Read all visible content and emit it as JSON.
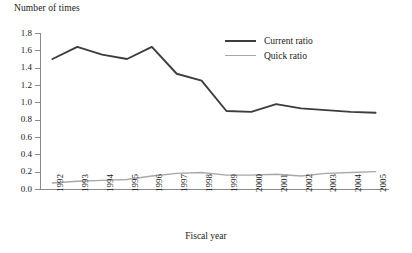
{
  "chart_data": {
    "type": "line",
    "title": "",
    "ylabel": "Number of times",
    "xlabel": "Fiscal year",
    "categories": [
      "1992",
      "1993",
      "1994",
      "1995",
      "1996",
      "1997",
      "1998",
      "1999",
      "2000",
      "2001",
      "2002",
      "2003",
      "2004",
      "2005"
    ],
    "series": [
      {
        "name": "Current ratio",
        "color": "#3d3d3d",
        "values": [
          1.5,
          1.64,
          1.55,
          1.5,
          1.64,
          1.33,
          1.25,
          0.9,
          0.89,
          0.98,
          0.93,
          0.91,
          0.89,
          0.88
        ]
      },
      {
        "name": "Quick ratio",
        "color": "#a8a8a8",
        "values": [
          0.07,
          0.09,
          0.1,
          0.11,
          0.15,
          0.18,
          0.19,
          0.16,
          0.16,
          0.17,
          0.15,
          0.18,
          0.19,
          0.2
        ]
      }
    ],
    "ylim": [
      0.0,
      1.8
    ],
    "ytick_values": [
      0.0,
      0.2,
      0.4,
      0.6,
      0.8,
      1.0,
      1.2,
      1.4,
      1.6,
      1.8
    ],
    "ytick_labels": [
      "0.0",
      "0.2",
      "0.4",
      "0.6",
      "0.8",
      "1.0",
      "1.2",
      "1.4",
      "1.6",
      "1.8"
    ],
    "grid": false,
    "legend_position": "top-right"
  },
  "axes": {
    "y_title": "Number of times",
    "x_title": "Fiscal year"
  },
  "legend": {
    "entries": [
      {
        "label": "Current ratio",
        "color": "#3d3d3d"
      },
      {
        "label": "Quick ratio",
        "color": "#a8a8a8"
      }
    ]
  },
  "colors": {
    "current_ratio": "#3d3d3d",
    "quick_ratio": "#a8a8a8",
    "axis": "#8a8a8a",
    "text": "#1a1a1a",
    "background": "#ffffff"
  }
}
